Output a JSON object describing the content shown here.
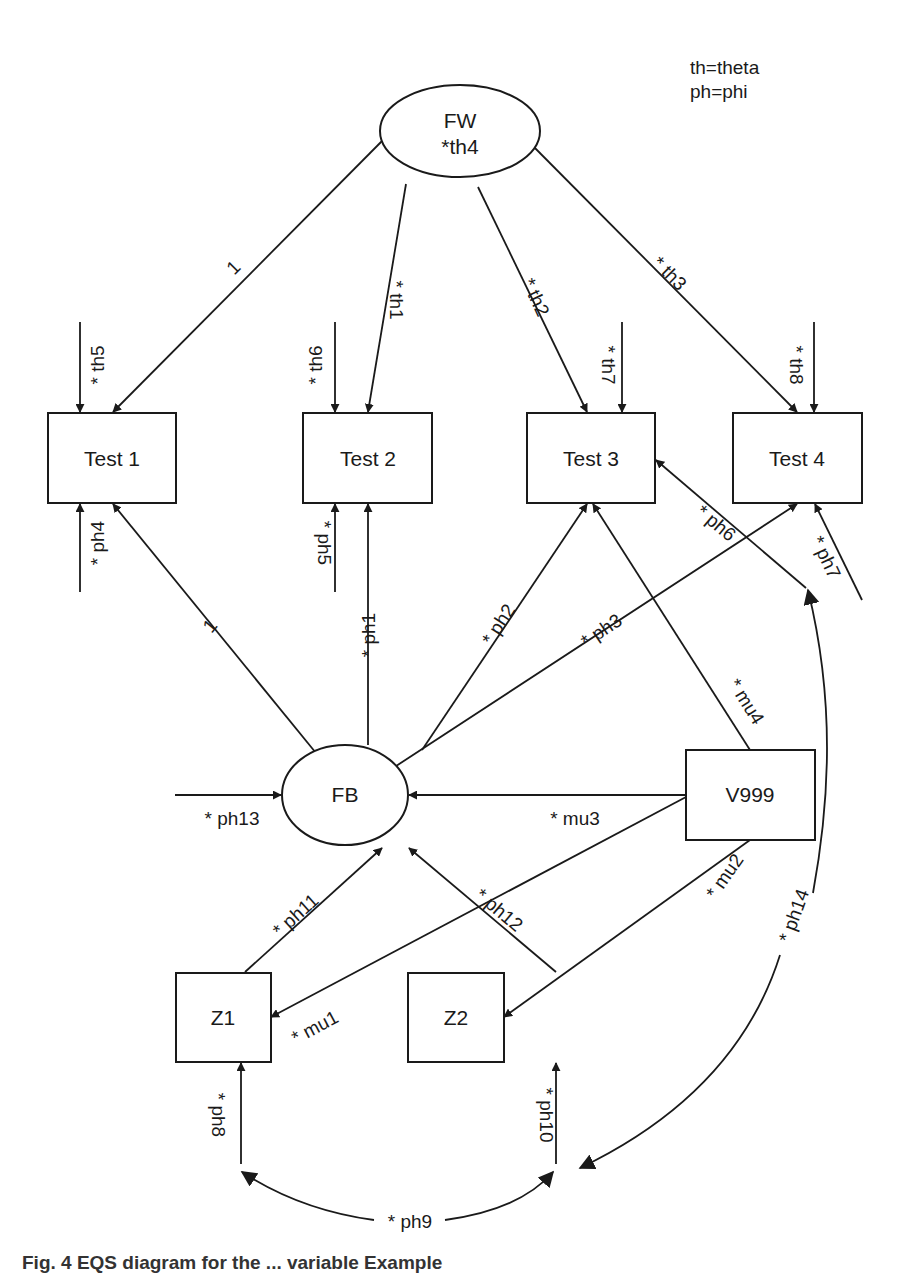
{
  "legend": {
    "line1": "th=theta",
    "line2": "ph=phi"
  },
  "caption": "Fig. 4 EQS diagram for the ... variable Example",
  "nodes": {
    "fw": {
      "label": "FW",
      "sublabel": "*th4",
      "shape": "ellipse"
    },
    "fb": {
      "label": "FB",
      "shape": "ellipse"
    },
    "test1": {
      "label": "Test 1",
      "shape": "rect"
    },
    "test2": {
      "label": "Test 2",
      "shape": "rect"
    },
    "test3": {
      "label": "Test 3",
      "shape": "rect"
    },
    "test4": {
      "label": "Test 4",
      "shape": "rect"
    },
    "v999": {
      "label": "V999",
      "shape": "rect"
    },
    "z1": {
      "label": "Z1",
      "shape": "rect"
    },
    "z2": {
      "label": "Z2",
      "shape": "rect"
    }
  },
  "edges": {
    "fw_test1": "1",
    "fw_test2": "* th1",
    "fw_test3": "* th2",
    "fw_test4": "* th3",
    "err_test1": "* th5",
    "err_test2": "* th6",
    "err_test3": "* th7",
    "err_test4": "* th8",
    "fb_test1": "1",
    "fb_test2": "* ph1",
    "fb_test3": "* ph2",
    "fb_test4": "* ph3",
    "ext_test1": "* ph4",
    "ext_test2": "* ph5",
    "test3_ph14": "* ph6",
    "ext_test4": "* ph7",
    "ext_z1": "* ph8",
    "cov_z1_z2": "* ph9",
    "ext_z2": "* ph10",
    "z1_fb": "* ph11",
    "z2_fb": "* ph12",
    "ext_fb": "* ph13",
    "cov_ph14": "* ph14",
    "v999_z1": "* mu1",
    "v999_z2": "* mu2",
    "v999_fb": "* mu3",
    "v999_test3": "* mu4"
  }
}
